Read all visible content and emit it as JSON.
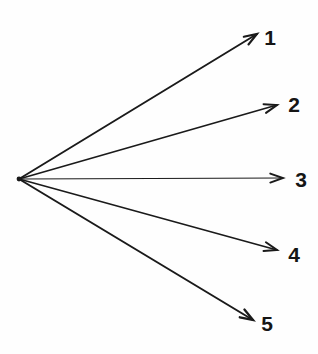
{
  "figure": {
    "type": "ray-fan-diagram",
    "width": 318,
    "height": 354,
    "background_color": "#fefefe",
    "stroke_color": "#1a1a1a",
    "label_color": "#151515",
    "origin": {
      "x": 19,
      "y": 179
    },
    "caption": ""
  },
  "chart_data": {
    "type": "scatter",
    "title": "",
    "xlabel": "",
    "ylabel": "",
    "grid": false,
    "legend": "none",
    "origin": {
      "x": 19,
      "y": 179
    },
    "categories": [
      "1",
      "2",
      "3",
      "4",
      "5"
    ],
    "series": [
      {
        "name": "ray-angles-degrees",
        "values": [
          31.3,
          16.3,
          0.0,
          -15.5,
          -26.9
        ]
      },
      {
        "name": "ray-lengths-px",
        "values": [
          278.6,
          268.9,
          264.0,
          264.3,
          248.7
        ]
      }
    ],
    "points": [
      {
        "label": "1",
        "tip_x": 257,
        "tip_y": 34
      },
      {
        "label": "2",
        "tip_x": 277,
        "tip_y": 105
      },
      {
        "label": "3",
        "tip_x": 283,
        "tip_y": 178
      },
      {
        "label": "4",
        "tip_x": 277,
        "tip_y": 250
      },
      {
        "label": "5",
        "tip_x": 253,
        "tip_y": 320
      }
    ]
  },
  "rays": [
    {
      "id": "ray-1",
      "label": "1",
      "x1": 19,
      "y1": 179,
      "x2": 257,
      "y2": 34,
      "stroke_width": 1.9,
      "label_x": 270,
      "label_y": 37
    },
    {
      "id": "ray-2",
      "label": "2",
      "x1": 19,
      "y1": 179,
      "x2": 277,
      "y2": 105,
      "stroke_width": 1.7,
      "label_x": 294,
      "label_y": 104
    },
    {
      "id": "ray-3",
      "label": "3",
      "x1": 19,
      "y1": 179,
      "x2": 283,
      "y2": 178,
      "stroke_width": 1.2,
      "label_x": 301,
      "label_y": 179
    },
    {
      "id": "ray-4",
      "label": "4",
      "x1": 19,
      "y1": 179,
      "x2": 277,
      "y2": 250,
      "stroke_width": 1.7,
      "label_x": 294,
      "label_y": 254
    },
    {
      "id": "ray-5",
      "label": "5",
      "x1": 19,
      "y1": 179,
      "x2": 253,
      "y2": 320,
      "stroke_width": 2.0,
      "label_x": 267,
      "label_y": 323
    }
  ]
}
